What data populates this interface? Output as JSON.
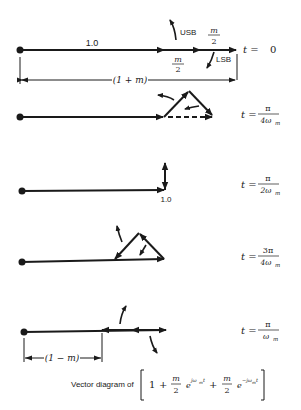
{
  "diagram": {
    "title": "Vector diagram of",
    "expression": {
      "one": "1",
      "plus1": "+",
      "m_num1": "m",
      "m_den1": "2",
      "exp1_base": "e",
      "exp1_power": "jω",
      "exp1_sub": "m",
      "exp1_t": "t",
      "plus2": "+",
      "m_num2": "m",
      "m_den2": "2",
      "exp2_base": "e",
      "exp2_power": "−jω",
      "exp2_sub": "m",
      "exp2_t": "t"
    },
    "colors": {
      "ink": "#1a1a1a",
      "background": "#ffffff"
    },
    "panels": [
      {
        "id": "t0",
        "time_label": {
          "lhs": "t =",
          "value": "0"
        },
        "carrier_label": "1.0",
        "usb_label": "USB",
        "lsb_label": "LSB",
        "sideband_num": "m",
        "sideband_den": "2",
        "dimension_label": "(1 + m)"
      },
      {
        "id": "t_pi_4",
        "time_label": {
          "lhs": "t =",
          "num": "π",
          "den": "4ω",
          "den_sub": "m"
        }
      },
      {
        "id": "t_pi_2",
        "time_label": {
          "lhs": "t =",
          "num": "π",
          "den": "2ω",
          "den_sub": "m"
        },
        "carrier_label": "1.0"
      },
      {
        "id": "t_3pi_4",
        "time_label": {
          "lhs": "t =",
          "num": "3π",
          "den": "4ω",
          "den_sub": "m"
        }
      },
      {
        "id": "t_pi",
        "time_label": {
          "lhs": "t =",
          "num": "π",
          "den": "ω",
          "den_sub": "m"
        },
        "dimension_label": "(1 − m)"
      }
    ]
  }
}
